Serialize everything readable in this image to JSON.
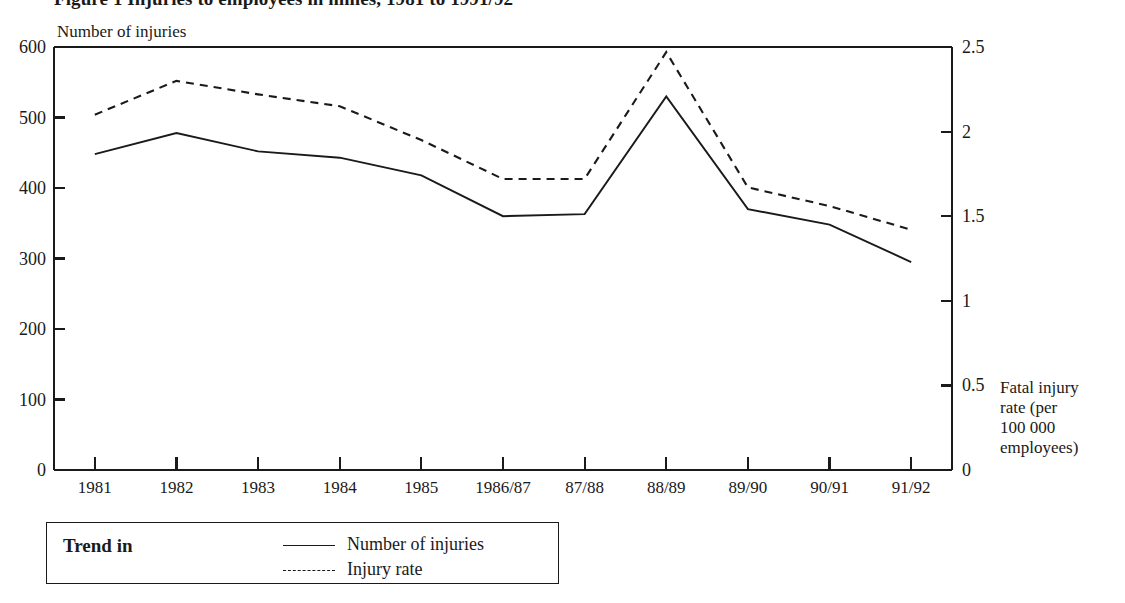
{
  "figure": {
    "title": "Figure 1 Injuries to employees in mines, 1981 to 1991/92",
    "left_axis_title": "Number of injuries",
    "right_axis_title_lines": [
      "Fatal injury",
      "rate (per",
      "100 000",
      "employees)"
    ]
  },
  "legend": {
    "heading": "Trend in",
    "entries": [
      {
        "label": "Number of injuries",
        "style": "solid"
      },
      {
        "label": "Injury rate",
        "style": "dashed"
      }
    ]
  },
  "chart_data": {
    "type": "line",
    "title": "Figure 1 Injuries to employees in mines, 1981 to 1991/92",
    "xlabel": "",
    "ylabel": "Number of injuries",
    "y2label": "Fatal injury rate (per 100 000 employees)",
    "categories": [
      "1981",
      "1982",
      "1983",
      "1984",
      "1985",
      "1986/87",
      "87/88",
      "88/89",
      "89/90",
      "90/91",
      "91/92"
    ],
    "series": [
      {
        "name": "Number of injuries",
        "style": "solid",
        "axis": "left",
        "values": [
          448,
          478,
          452,
          443,
          418,
          360,
          363,
          530,
          370,
          348,
          295
        ]
      },
      {
        "name": "Injury rate",
        "style": "dashed",
        "axis": "right",
        "values": [
          2.1,
          2.3,
          2.22,
          2.15,
          1.95,
          1.72,
          1.72,
          2.47,
          1.67,
          1.56,
          1.42
        ]
      }
    ],
    "ylim": [
      0,
      600
    ],
    "yticks": [
      0,
      100,
      200,
      300,
      400,
      500,
      600
    ],
    "ytick_labels": [
      "0",
      "100",
      "200",
      "300",
      "400",
      "500",
      "600"
    ],
    "y2lim": [
      0,
      2.5
    ],
    "y2ticks": [
      0,
      0.5,
      1,
      1.5,
      2,
      2.5
    ],
    "y2tick_labels": [
      "0",
      "0.5",
      "1",
      "1.5",
      "2",
      "2.5"
    ],
    "grid": false,
    "legend_position": "below-left",
    "line_color": "#1a1a1a"
  }
}
